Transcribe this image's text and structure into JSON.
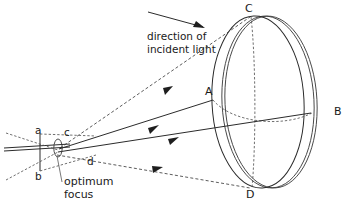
{
  "figure": {
    "background_color": "#ffffff",
    "line_color": "#2b2b2b",
    "width": 348,
    "height": 207
  },
  "annotations": {
    "direction_line1": "direction of",
    "direction_line2": "incident light",
    "optimum_line1": "optimum",
    "optimum_line2": "focus"
  },
  "labels": {
    "dish_top": "C",
    "dish_bottom": "D",
    "dish_left": "A",
    "dish_right": "B",
    "focus_a": "a",
    "focus_b": "b",
    "focus_c": "c",
    "focus_d": "d"
  },
  "elements": {
    "dish_front_rim": "front-rim-ellipse",
    "dish_back_rim": "back-rim-ellipse",
    "dish_vertical_axis": "vertical-axis-dashed",
    "dish_back_arc": "back-rim-arc-dashed",
    "optical_axis": "optical-axis-line",
    "ray_to_c": "ray-focus-to-c-dashed",
    "ray_to_a": "ray-focus-to-a-solid",
    "ray_to_b": "ray-focus-to-b-solid",
    "ray_to_d": "ray-focus-to-d-dashed",
    "focus_blur_ellipse": "optimum-focus-ellipse",
    "aperture_plane": "aperture-plane-line",
    "incident_arrow": "incident-light-arrow"
  }
}
